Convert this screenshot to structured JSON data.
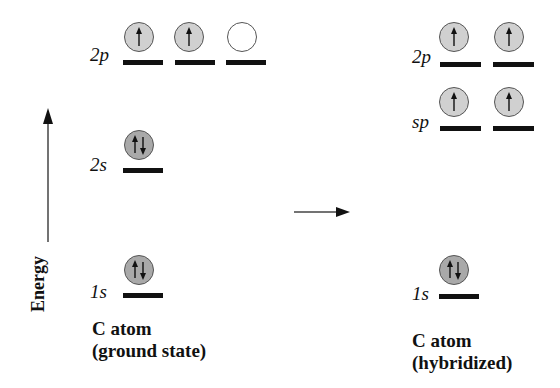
{
  "axis": {
    "label": "Energy"
  },
  "transition_arrow": "right-arrow",
  "colors": {
    "filled_orbital": "#c8c8c8",
    "paired_orbital": "#a9a9a9",
    "empty_orbital": "#ffffff",
    "bar": "#111111"
  },
  "ground_state": {
    "caption_line1": "C atom",
    "caption_line2": "(ground state)",
    "levels": [
      {
        "label": "2p",
        "orbitals": [
          "up",
          "up",
          "empty"
        ]
      },
      {
        "label": "2s",
        "orbitals": [
          "pair"
        ]
      },
      {
        "label": "1s",
        "orbitals": [
          "pair"
        ]
      }
    ]
  },
  "hybridized": {
    "caption_line1": "C atom",
    "caption_line2": "(hybridized)",
    "levels": [
      {
        "label": "2p",
        "orbitals": [
          "up",
          "up"
        ]
      },
      {
        "label": "sp",
        "orbitals": [
          "up",
          "up"
        ]
      },
      {
        "label": "1s",
        "orbitals": [
          "pair"
        ]
      }
    ]
  }
}
